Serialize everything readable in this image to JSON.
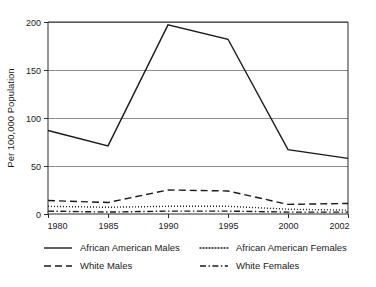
{
  "chart_data": {
    "type": "line",
    "title": "",
    "xlabel": "",
    "ylabel": "Per 100,000 Population",
    "categories": [
      "1980",
      "1985",
      "1990",
      "1995",
      "2000",
      "2002"
    ],
    "ylim": [
      0,
      200
    ],
    "yticks": [
      0,
      50,
      100,
      150,
      200
    ],
    "ytick_labels": [
      "0",
      "50",
      "100",
      "150",
      "200"
    ],
    "grid": "horizontal",
    "legend_position": "below-plot",
    "series": [
      {
        "name": "African American Males",
        "line_style": "solid",
        "values": [
          87,
          71,
          197,
          182,
          67,
          58
        ]
      },
      {
        "name": "African American Females",
        "line_style": "dotted",
        "values": [
          8,
          7,
          8,
          8,
          5,
          4
        ]
      },
      {
        "name": "White Males",
        "line_style": "dashed",
        "values": [
          14,
          12,
          25,
          24,
          10,
          11
        ]
      },
      {
        "name": "White Females",
        "line_style": "dash-dot",
        "values": [
          3,
          2,
          3,
          3,
          2,
          2
        ]
      }
    ]
  },
  "legend": {
    "entries": [
      {
        "label": "African American Males"
      },
      {
        "label": "African American Females"
      },
      {
        "label": "White Males"
      },
      {
        "label": "White Females"
      }
    ]
  },
  "colors": {
    "ink": "#1a1a1a",
    "grid": "#8c8c8c",
    "background": "#ffffff"
  }
}
